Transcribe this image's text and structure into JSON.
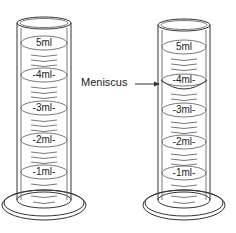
{
  "diagram": {
    "cylinders": [
      {
        "id": "left",
        "cx": 44,
        "marks": [
          "5ml",
          "4ml",
          "3ml",
          "2ml",
          "1ml"
        ],
        "meniscus": false
      },
      {
        "id": "right",
        "cx": 184,
        "marks": [
          "5ml",
          "4ml",
          "3ml",
          "2ml",
          "1ml"
        ],
        "meniscus": true
      }
    ],
    "annotation": {
      "label": "Meniscus",
      "points_to": "right cylinder 4ml mark"
    }
  }
}
